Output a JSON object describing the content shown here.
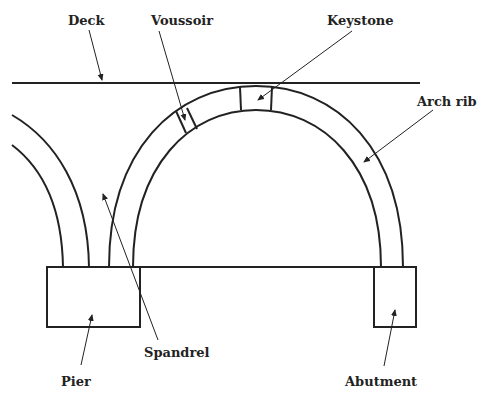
{
  "diagram": {
    "stroke_color": "#222222",
    "background": "#ffffff",
    "labels": {
      "deck": "Deck",
      "voussoir": "Voussoir",
      "keystone": "Keystone",
      "arch_rib": "Arch rib",
      "spandrel": "Spandrel",
      "pier": "Pier",
      "abutment": "Abutment"
    }
  }
}
